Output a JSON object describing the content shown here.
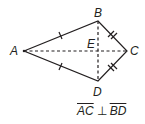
{
  "figure": {
    "type": "kite",
    "points": {
      "A": {
        "label": "A",
        "x": 24,
        "y": 51
      },
      "B": {
        "label": "B",
        "x": 98,
        "y": 21
      },
      "C": {
        "label": "C",
        "x": 127,
        "y": 51
      },
      "D": {
        "label": "D",
        "x": 98,
        "y": 81
      },
      "E": {
        "label": "E",
        "x": 98,
        "y": 51
      }
    },
    "sides": [
      {
        "from": "A",
        "to": "B",
        "ticks": 1
      },
      {
        "from": "A",
        "to": "D",
        "ticks": 1
      },
      {
        "from": "B",
        "to": "C",
        "ticks": 2
      },
      {
        "from": "D",
        "to": "C",
        "ticks": 2
      }
    ],
    "diagonals": [
      {
        "from": "A",
        "to": "C",
        "style": "dashed"
      },
      {
        "from": "B",
        "to": "D",
        "style": "dashed"
      }
    ],
    "line_color": "#231f20"
  },
  "caption": {
    "seg1": "AC",
    "relation": "⊥",
    "seg2": "BD"
  }
}
